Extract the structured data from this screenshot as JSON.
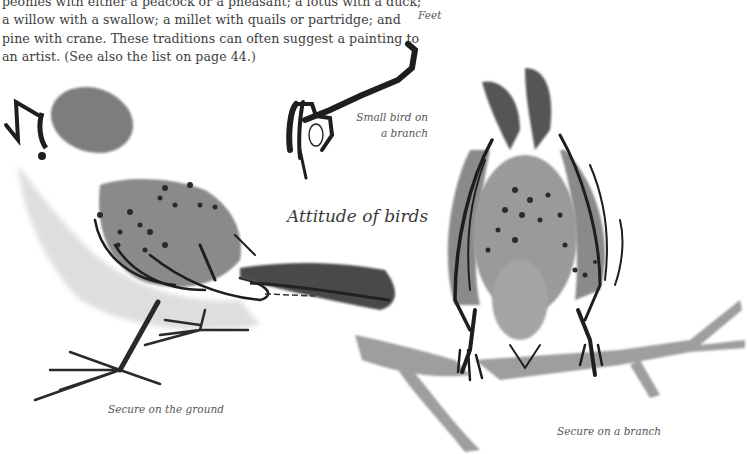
{
  "page": {
    "body_lines": [
      "peonies with either a peacock or a pheasant; a lotus with a duck;",
      "a willow with a swallow; a millet with quails or partridge; and",
      "pine with crane. These traditions can often suggest a painting to",
      "an artist. (See also the list on page 44.)"
    ]
  },
  "captions": {
    "feet": "Feet",
    "small_bird_line1": "Small bird on",
    "small_bird_line2": "a branch",
    "title": "Attitude of birds",
    "ground": "Secure on the ground",
    "branch": "Secure on a branch"
  },
  "illustrations": {
    "ink_color": "#1e1e1e",
    "wash_dark": "#6e6e6e",
    "wash_mid": "#8c8c8c",
    "wash_light": "#c4c4c4",
    "items": [
      "bird-foot-sketch",
      "bird-standing-on-ground",
      "bird-perched-on-branch-rear-view"
    ]
  }
}
